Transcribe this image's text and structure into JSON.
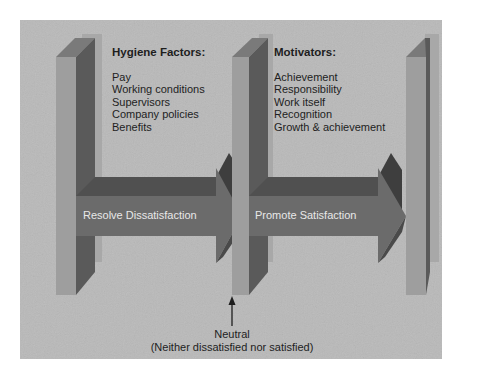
{
  "diagram": {
    "type": "herzberg-two-factor",
    "colors": {
      "background": "#b9b9b9",
      "pillar_front": "#9e9e9e",
      "pillar_side": "#5a5a5a",
      "pillar_top": "#7a7a7a",
      "pillar_back": "#a8a8a8",
      "arrow_body": "#6b6b6b",
      "arrow_top": "#505050",
      "arrow_head_dark": "#3e3e3e",
      "arrow_label": "#e8e8e8",
      "text": "#1e1e1e"
    },
    "hygiene": {
      "heading": "Hygiene Factors:",
      "items": [
        "Pay",
        "Working conditions",
        "Supervisors",
        "Company policies",
        "Benefits"
      ]
    },
    "motivators": {
      "heading": "Motivators:",
      "items": [
        "Achievement",
        "Responsibility",
        "Work itself",
        "Recognition",
        "Growth & achievement"
      ]
    },
    "arrows": [
      {
        "label": "Resolve Dissatisfaction"
      },
      {
        "label": "Promote Satisfaction"
      }
    ],
    "neutral": {
      "line1": "Neutral",
      "line2": "(Neither dissatisfied nor satisfied)"
    }
  }
}
